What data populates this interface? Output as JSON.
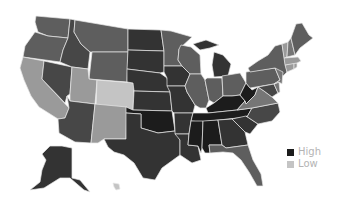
{
  "map": {
    "type": "choropleth",
    "region": "United States",
    "palette": {
      "high": "#1c1c1c",
      "dark": "#333333",
      "darkmid": "#474747",
      "mid": "#5e5e5e",
      "midlight": "#767676",
      "light": "#9a9a9a",
      "low": "#c4c4c4"
    },
    "states": [
      {
        "id": "WA",
        "shade": "mid",
        "points": "36,16 70,19 68,38 48,36 38,32 35,22"
      },
      {
        "id": "OR",
        "shade": "mid",
        "points": "35,32 48,36 68,38 63,50 60,62 23,57 25,46"
      },
      {
        "id": "CA",
        "shade": "light",
        "points": "23,57 44,61 42,79 69,108 65,118 58,119 39,107 31,96 24,80 20,68"
      },
      {
        "id": "NV",
        "shade": "darkmid",
        "points": "44,61 72,67 70,94 67,96 65,103 42,79"
      },
      {
        "id": "ID",
        "shade": "darkmid",
        "points": "70,19 75,20 74,32 81,44 90,52 88,69 72,67 60,62 63,50 68,38"
      },
      {
        "id": "MT",
        "shade": "mid",
        "points": "75,20 128,29 128,52 92,52 90,52 81,44 74,32"
      },
      {
        "id": "WY",
        "shade": "mid",
        "points": "92,52 128,52 127,82 89,79"
      },
      {
        "id": "UT",
        "shade": "light",
        "points": "72,67 88,69 89,79 97,80 95,104 70,101 70,94"
      },
      {
        "id": "CO",
        "shade": "low",
        "points": "97,80 134,83 133,110 96,107"
      },
      {
        "id": "AZ",
        "shade": "darkmid",
        "points": "70,101 95,104 91,143 75,142 59,133 58,119 65,118 69,108 67,96"
      },
      {
        "id": "NM",
        "shade": "light",
        "points": "95,104 127,107 126,139 104,139 98,143 91,143"
      },
      {
        "id": "ND",
        "shade": "dark",
        "points": "128,29 161,30 164,51 128,50"
      },
      {
        "id": "SD",
        "shade": "dark",
        "points": "128,50 164,51 164,72 160,73 127,69"
      },
      {
        "id": "NE",
        "shade": "dark",
        "points": "127,69 160,73 167,78 170,92 134,91 133,83 127,82"
      },
      {
        "id": "KS",
        "shade": "dark",
        "points": "134,91 170,92 172,111 133,110"
      },
      {
        "id": "OK",
        "shade": "high",
        "points": "126,107 133,110 172,111 175,131 158,133 141,128 141,114 126,113"
      },
      {
        "id": "TX",
        "shade": "dark",
        "points": "126,113 141,114 141,128 158,133 175,131 180,140 180,155 162,168 155,180 143,178 134,163 124,155 114,152 108,147 104,139 126,139"
      },
      {
        "id": "MN",
        "shade": "mid",
        "points": "161,30 171,31 192,37 179,49 178,60 182,66 164,66 164,51"
      },
      {
        "id": "IA",
        "shade": "dark",
        "points": "164,66 182,66 190,74 185,86 167,86 167,78 164,72"
      },
      {
        "id": "MO",
        "shade": "dark",
        "points": "167,86 185,86 187,92 195,105 193,113 174,113 172,111 170,92"
      },
      {
        "id": "AR",
        "shade": "dark",
        "points": "174,113 193,113 191,121 189,134 175,134 175,131"
      },
      {
        "id": "LA",
        "shade": "dark",
        "points": "175,134 189,134 188,145 198,146 201,160 192,163 180,155 180,140"
      },
      {
        "id": "WI",
        "shade": "mid",
        "points": "181,45 191,47 200,55 201,74 190,74 182,66 178,60 179,49"
      },
      {
        "id": "IL",
        "shade": "mid",
        "points": "190,74 201,74 205,80 209,100 206,108 200,108 195,105 187,92 185,86"
      },
      {
        "id": "MI-U",
        "shade": "dark",
        "points": "193,44 206,40 219,45 210,48 200,50"
      },
      {
        "id": "MI",
        "shade": "dark",
        "points": "214,52 223,55 231,64 228,76 214,77 212,65"
      },
      {
        "id": "IN",
        "shade": "mid",
        "points": "207,78 222,78 223,96 214,103 209,100 205,80"
      },
      {
        "id": "OH",
        "shade": "mid",
        "points": "222,76 240,73 246,83 240,95 232,96 223,96"
      },
      {
        "id": "KY",
        "shade": "high",
        "points": "206,108 214,103 223,96 232,96 240,95 245,101 237,110 208,113"
      },
      {
        "id": "WV",
        "shade": "high",
        "points": "240,95 246,83 252,90 258,87 255,95 246,104 245,101"
      },
      {
        "id": "TN",
        "shade": "high",
        "points": "193,113 208,113 237,110 252,108 247,117 200,122 191,121"
      },
      {
        "id": "MS",
        "shade": "high",
        "points": "191,121 203,121 202,148 201,153 198,146 188,145 189,134"
      },
      {
        "id": "AL",
        "shade": "high",
        "points": "203,121 218,120 222,145 209,145 210,153 205,153 202,148"
      },
      {
        "id": "GA",
        "shade": "dark",
        "points": "218,120 232,119 245,132 248,145 226,148 222,145"
      },
      {
        "id": "FL",
        "shade": "mid",
        "points": "209,145 222,145 226,148 248,145 253,160 261,174 263,186 257,186 249,172 241,160 233,153 223,152 210,153"
      },
      {
        "id": "SC",
        "shade": "dark",
        "points": "232,119 246,116 258,124 250,134 245,132"
      },
      {
        "id": "NC",
        "shade": "darkmid",
        "points": "247,117 252,108 278,103 280,112 272,121 258,124 246,116"
      },
      {
        "id": "VA",
        "shade": "midlight",
        "points": "237,110 245,101 246,104 255,95 258,87 264,91 272,97 278,103 252,108"
      },
      {
        "id": "PA",
        "shade": "mid",
        "points": "246,72 275,68 280,80 274,84 250,88 246,83"
      },
      {
        "id": "NY",
        "shade": "mid",
        "points": "248,68 258,61 268,55 275,46 282,44 285,62 287,72 283,76 275,68 250,72"
      },
      {
        "id": "MD",
        "shade": "darkmid",
        "points": "258,87 274,84 278,93 272,97 264,91"
      },
      {
        "id": "DE",
        "shade": "midlight",
        "points": "274,84 279,82 280,92 278,93"
      },
      {
        "id": "NJ",
        "shade": "midlight",
        "points": "275,68 283,72 282,84 279,82 274,84 280,80"
      },
      {
        "id": "CT",
        "shade": "light",
        "points": "285,65 294,63 294,69 287,72"
      },
      {
        "id": "RI",
        "shade": "light",
        "points": "294,63 297,63 297,67 294,69"
      },
      {
        "id": "MA",
        "shade": "light",
        "points": "284,58 298,57 301,61 297,63 285,65"
      },
      {
        "id": "VT",
        "shade": "light",
        "points": "282,44 288,42 287,57 284,58"
      },
      {
        "id": "NH",
        "shade": "midlight",
        "points": "288,42 291,38 295,55 287,57"
      },
      {
        "id": "ME",
        "shade": "mid",
        "points": "291,38 296,24 302,23 309,35 313,38 300,48 295,55"
      },
      {
        "id": "AK",
        "shade": "dark",
        "points": "50,146 62,146 72,148 72,178 80,180 90,192 84,190 70,178 60,178 44,188 30,190 40,182 42,170 46,160 42,154"
      },
      {
        "id": "HI",
        "shade": "low",
        "points": "113,183 119,184 120,189 116,190 114,187"
      }
    ]
  },
  "legend": {
    "items": [
      {
        "label": "High",
        "color": "#1c1c1c"
      },
      {
        "label": "Low",
        "color": "#c4c4c4"
      }
    ]
  }
}
